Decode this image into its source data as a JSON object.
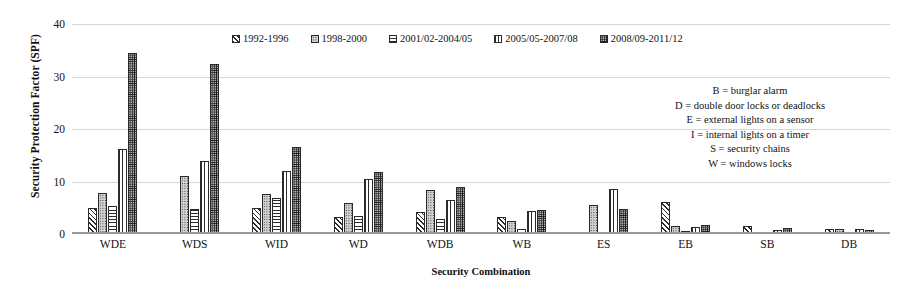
{
  "chart_data": {
    "type": "bar",
    "title": "",
    "xlabel": "Security Combination",
    "ylabel": "Security Protection Factor (SPF)",
    "ylim": [
      0,
      40
    ],
    "yticks": [
      0,
      10,
      20,
      30,
      40
    ],
    "grid": true,
    "legend_position": "top-center",
    "categories": [
      "WDE",
      "WDS",
      "WID",
      "WD",
      "WDB",
      "WB",
      "ES",
      "EB",
      "SB",
      "DB"
    ],
    "series": [
      {
        "name": "1992-1996",
        "values": [
          4.9,
          0,
          4.9,
          3.2,
          4.2,
          3.2,
          0,
          6.1,
          1.6,
          1.0
        ]
      },
      {
        "name": "1998-2000",
        "values": [
          7.8,
          11.0,
          7.6,
          6.0,
          8.4,
          2.4,
          5.6,
          1.6,
          0.1,
          1.0
        ]
      },
      {
        "name": "2001/02-2004/05",
        "values": [
          5.4,
          4.8,
          6.8,
          3.5,
          2.9,
          1.0,
          0.3,
          0.5,
          0.4,
          0.1
        ]
      },
      {
        "name": "2005/05-2007/08",
        "values": [
          16.2,
          14.0,
          12.0,
          10.5,
          6.5,
          4.3,
          8.5,
          1.4,
          0.8,
          0.9
        ]
      },
      {
        "name": "2008/09-2011/12",
        "values": [
          34.5,
          32.3,
          16.5,
          11.9,
          9.0,
          4.6,
          4.7,
          1.8,
          1.1,
          0.8
        ]
      }
    ],
    "annotations": [
      "B = burglar alarm",
      "D = double door locks or deadlocks",
      "E = external lights on a sensor",
      "I = internal lights on a timer",
      "S = security chains",
      "W = windows locks"
    ]
  },
  "colors": {
    "axis": "#9a9a9a",
    "grid": "#d6d6d6",
    "bar_outline": "#2a2a2a",
    "text": "#111111",
    "background": "#ffffff"
  }
}
